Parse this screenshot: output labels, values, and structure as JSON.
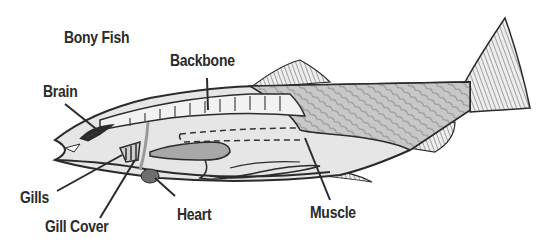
{
  "diagram": {
    "title": "Bony Fish",
    "labels": {
      "backbone": "Backbone",
      "brain": "Brain",
      "gills": "Gills",
      "gill_cover": "Gill Cover",
      "heart": "Heart",
      "muscle": "Muscle"
    },
    "colors": {
      "outline": "#2b2b2b",
      "body_fill": "#d9d9d9",
      "muscle_fill": "#bdbdbd",
      "organ_fill": "#8a8a8a",
      "background": "#ffffff"
    }
  }
}
